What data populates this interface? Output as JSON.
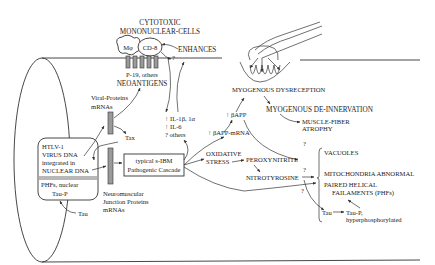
{
  "diagram": {
    "cells": {
      "title_line1": "CYTOTOXIC",
      "title_line2": "MONONUCLEAR-CELLS",
      "macrophage": "Mφ",
      "cd8": "CD-8"
    },
    "enhances": "ENHANCES",
    "enhances_q": "?",
    "neoantigens": {
      "line1": "P-19, others",
      "line2": "NEOANTIGENS"
    },
    "viral_proteins": {
      "line1": "Viral-Proteins",
      "line2": "mRNAs"
    },
    "tax": "Tax",
    "htlv_box": {
      "line1": "HTLV-1",
      "line2": "VIRUS DNA",
      "line3": "integrated in",
      "line4": "NUCLEAR DNA",
      "phfs": "PHFs, nuclear",
      "taup": "Tau-P"
    },
    "tau_left": "Tau",
    "nmj": {
      "line1": "Neuromuscular",
      "line2": "Junction Proteins",
      "line3": "mRNAs"
    },
    "cascade": {
      "line1": "typical s-IBM",
      "line2": "Pathogenic Cascade"
    },
    "cytokines": {
      "line1": "↑ IL-1β, 1α",
      "line2": "↑ IL-6",
      "line3": "? others"
    },
    "bapp": "↑ βAPP",
    "bapp_mrna": "↑ βAPP-mRNA",
    "dysreception": "MYOGENOUS DYSRECEPTION",
    "denervation": "MYOGENOUS DE-INNERVATION",
    "atrophy": {
      "line1": "MUSCLE-FIBER",
      "line2": "ATROPHY"
    },
    "oxidative": {
      "line1": "OXIDATIVE",
      "line2": "STRESS"
    },
    "peroxynitrite": "PEROXYNITRITE",
    "nitrotyrosine": "NITROTYROSINE",
    "outcomes": {
      "vacuoles": "VACUOLES",
      "mito": "MITOCHONDRIA ABNORMAL",
      "phf_line1": "PAIRED HELICAL",
      "phf_line2": "FAILAMENTS (PHFs)",
      "tau": "Tau",
      "taup_line1": "Tau-P,",
      "taup_line2": "hyperphosphorylated"
    },
    "question": "?"
  }
}
